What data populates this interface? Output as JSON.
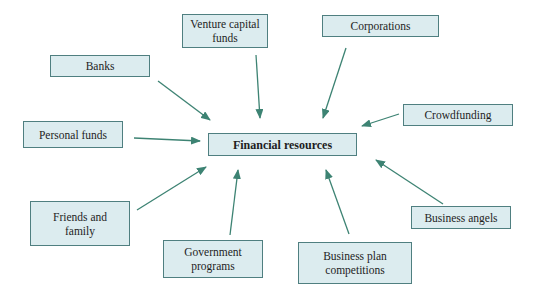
{
  "diagram": {
    "center": {
      "label": "Financial resources"
    },
    "sources": [
      {
        "id": "venture-capital-funds",
        "label": "Venture capital funds"
      },
      {
        "id": "corporations",
        "label": "Corporations"
      },
      {
        "id": "banks",
        "label": "Banks"
      },
      {
        "id": "crowdfunding",
        "label": "Crowdfunding"
      },
      {
        "id": "personal-funds",
        "label": "Personal funds"
      },
      {
        "id": "friends-and-family",
        "label": "Friends and family"
      },
      {
        "id": "business-angels",
        "label": "Business angels"
      },
      {
        "id": "government-programs",
        "label": "Government programs"
      },
      {
        "id": "business-plan-competitions",
        "label": "Business plan competitions"
      }
    ],
    "colors": {
      "box_fill": "#dcecef",
      "box_border": "#4f7f80",
      "arrow": "#3d8373"
    }
  }
}
